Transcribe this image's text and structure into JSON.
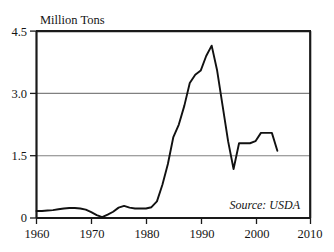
{
  "chart_data": {
    "type": "line",
    "title": "",
    "subtitle": "",
    "xlabel": "",
    "ylabel": "Million Tons",
    "ylabel_position": "above-axis-top-left",
    "xlim": [
      1960,
      2010
    ],
    "ylim": [
      0,
      4.5
    ],
    "grid": "horizontal-only",
    "legend": "none",
    "annotations": [
      {
        "name": "source-note",
        "text": "Source: USDA",
        "x": 1998.5,
        "y": 0.42,
        "style": "italic"
      }
    ],
    "y_ticks": [
      0,
      1.5,
      3.0,
      4.5
    ],
    "y_tick_labels": [
      "0",
      "1.5",
      "3.0",
      "4.5"
    ],
    "x_ticks": [
      1960,
      1970,
      1980,
      1990,
      2000,
      2010
    ],
    "x_tick_labels": [
      "1960",
      "1970",
      "1980",
      "1990",
      "2000",
      "2010"
    ],
    "series": [
      {
        "name": "Production",
        "color": "#111111",
        "x": [
          1960,
          1961,
          1962,
          1963,
          1964,
          1965,
          1966,
          1967,
          1968,
          1969,
          1970,
          1971,
          1972,
          1973,
          1974,
          1975,
          1976,
          1977,
          1978,
          1979,
          1980,
          1981,
          1982,
          1983,
          1984,
          1985,
          1986,
          1987,
          1988,
          1989,
          1990,
          1991,
          1992,
          1993,
          1994,
          1995,
          1996,
          1997,
          1998,
          1999,
          2000,
          2001,
          2002,
          2003,
          2004
        ],
        "values": [
          0.17,
          0.17,
          0.18,
          0.19,
          0.21,
          0.23,
          0.24,
          0.24,
          0.23,
          0.2,
          0.14,
          0.07,
          0.02,
          0.08,
          0.15,
          0.25,
          0.29,
          0.25,
          0.23,
          0.23,
          0.23,
          0.26,
          0.4,
          0.8,
          1.3,
          1.95,
          2.25,
          2.7,
          3.25,
          3.45,
          3.55,
          3.9,
          4.15,
          3.55,
          2.7,
          1.85,
          1.18,
          1.8,
          1.8,
          1.8,
          1.85,
          2.05,
          2.05,
          2.05,
          1.62
        ]
      }
    ]
  },
  "axes": {
    "y_axis_label": "Million Tons",
    "y_tick_labels": [
      "4.5",
      "3.0",
      "1.5",
      "0"
    ],
    "x_tick_labels": [
      "1960",
      "1970",
      "1980",
      "1990",
      "2000",
      "2010"
    ]
  },
  "source": {
    "label": "Source: USDA"
  },
  "colors": {
    "line": "#111111",
    "grid": "#808080",
    "frame": "#1a1a1a",
    "text": "#141414",
    "background": "#ffffff"
  }
}
